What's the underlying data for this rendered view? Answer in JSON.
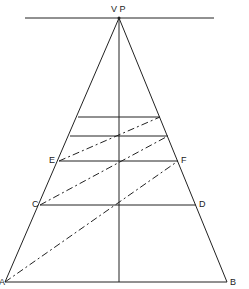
{
  "diagram": {
    "labels": {
      "vp": "V P",
      "a": "A",
      "b": "B",
      "c": "C",
      "d": "D",
      "e": "E",
      "f": "F"
    },
    "colors": {
      "line": "#222222",
      "background": "#ffffff"
    }
  }
}
